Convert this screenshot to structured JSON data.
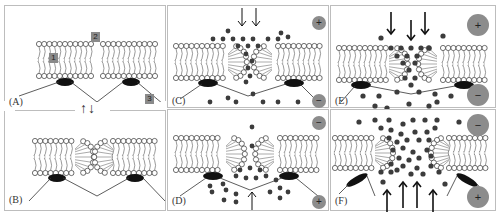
{
  "figure": {
    "panels": [
      {
        "id": "A",
        "label": "(A)",
        "state": "intact-bilayer"
      },
      {
        "id": "B",
        "label": "(B)",
        "state": "toroidal-pore-forming"
      },
      {
        "id": "C",
        "label": "(C)",
        "state": "pore-ions-flow-down",
        "top_charge": "+",
        "bottom_charge": "−"
      },
      {
        "id": "D",
        "label": "(D)",
        "state": "pore-ions-flow-up",
        "top_charge": "−",
        "bottom_charge": "+"
      },
      {
        "id": "E",
        "label": "(E)",
        "state": "larger-pore-ions-flow-down",
        "top_charge": "+",
        "bottom_charge": "−"
      },
      {
        "id": "F",
        "label": "(F)",
        "state": "large-pore-ions-flow-up",
        "top_charge": "−",
        "bottom_charge": "+"
      }
    ],
    "callouts": [
      {
        "number": "1",
        "target": "lipid-bilayer"
      },
      {
        "number": "2",
        "target": "membrane-gap"
      },
      {
        "number": "3",
        "target": "tether-line"
      }
    ],
    "transition_arrows": "↑↓",
    "colors": {
      "border": "#bdbdbd",
      "ion": "#3c3c3c",
      "charge_circle": "#8c8c8c",
      "protein": "#111111",
      "callout_box": "#8a8a8a",
      "lipid_line": "#555555"
    }
  }
}
